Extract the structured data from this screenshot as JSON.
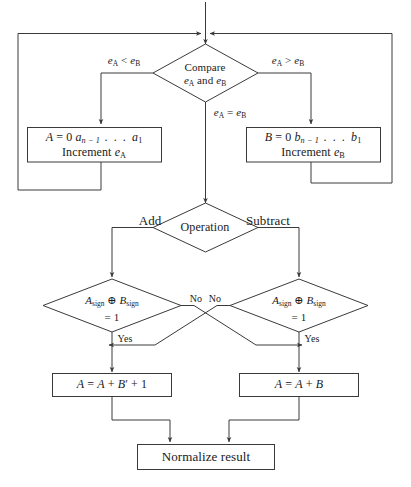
{
  "diagram": {
    "line_color": "#3a3a3a",
    "background": "#ffffff",
    "nodes": {
      "compare": {
        "shape": "diamond",
        "line1": "Compare",
        "line2_pre": "e",
        "line2_sub1": "A",
        "line2_mid": " and ",
        "line2_pre2": "e",
        "line2_sub2": "B"
      },
      "align_a": {
        "shape": "process",
        "line1_a": "A",
        "line1_b": " = 0 ",
        "line1_c": "a",
        "line1_sub": "n − 1",
        "line1_dots": " . . . ",
        "line1_d": "a",
        "line1_sub2": "1",
        "line2_pre": "Increment ",
        "line2_e": "e",
        "line2_sub": "A"
      },
      "align_b": {
        "shape": "process",
        "line1_a": "B",
        "line1_b": " = 0 ",
        "line1_c": "b",
        "line1_sub": "n − 1",
        "line1_dots": " . . . ",
        "line1_d": "b",
        "line1_sub2": "1",
        "line2_pre": "Increment ",
        "line2_e": "e",
        "line2_sub": "B"
      },
      "operation": {
        "shape": "diamond",
        "label": "Operation"
      },
      "sign_check_left": {
        "shape": "diamond",
        "line1_a": "A",
        "line1_sub1": "sign",
        "line1_op": " ⊕ ",
        "line1_b": "B",
        "line1_sub2": "sign",
        "line2": "= 1"
      },
      "sign_check_right": {
        "shape": "diamond",
        "line1_a": "A",
        "line1_sub1": "sign",
        "line1_op": " ⊕ ",
        "line1_b": "B",
        "line1_sub2": "sign",
        "line2": "= 1"
      },
      "result_sub": {
        "shape": "process",
        "a": "A",
        "eq": " = ",
        "b": "A",
        "plus1": " + ",
        "c": "B",
        "prime": "′",
        "plus2": " + 1"
      },
      "result_add": {
        "shape": "process",
        "a": "A",
        "eq": " = ",
        "b": "A",
        "plus1": " + ",
        "c": "B"
      },
      "normalize": {
        "shape": "process",
        "label": "Normalize result"
      }
    },
    "edge_labels": {
      "e_less": {
        "pre": "e",
        "sub1": "A",
        "op": " < ",
        "pre2": "e",
        "sub2": "B"
      },
      "e_greater": {
        "pre": "e",
        "sub1": "A",
        "op": " > ",
        "pre2": "e",
        "sub2": "B"
      },
      "e_equal": {
        "pre": "e",
        "sub1": "A",
        "op": " = ",
        "pre2": "e",
        "sub2": "B"
      },
      "add": "Add",
      "subtract": "Subtract",
      "no_left": "No",
      "no_right": "No",
      "yes_left": "Yes",
      "yes_right": "Yes"
    }
  }
}
